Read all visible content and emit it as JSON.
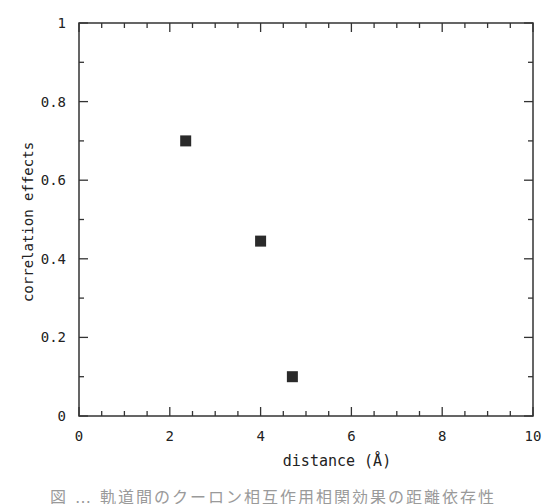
{
  "chart_data": {
    "type": "scatter",
    "title": "",
    "xlabel": "distance (Å)",
    "ylabel": "correlation effects",
    "xlim": [
      0,
      10
    ],
    "ylim": [
      0,
      1
    ],
    "x_ticks": [
      "0",
      "2",
      "4",
      "6",
      "8",
      "10"
    ],
    "y_ticks": [
      "0",
      "0.2",
      "0.4",
      "0.6",
      "0.8",
      "1"
    ],
    "x_minor_step": 0.5,
    "y_minor_step": 0.1,
    "grid": false,
    "legend": null,
    "marker": "filled-square",
    "marker_color": "#2a2a2a",
    "series": [
      {
        "name": "correlation effects",
        "x": [
          2.35,
          4.0,
          4.7
        ],
        "y": [
          0.7,
          0.445,
          0.1
        ]
      }
    ]
  },
  "caption": {
    "text": "図 … 軌道間のクーロン相互作用相関効果の距離依存性",
    "note": "caption truncated at bottom edge"
  }
}
